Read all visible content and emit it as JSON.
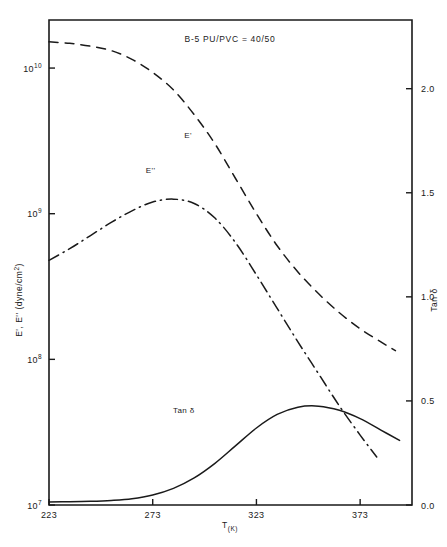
{
  "chart_data": {
    "type": "line",
    "title": "B-5  PU/PVC = 40/50",
    "xlabel": "T",
    "xlabel_sub": "(K)",
    "ylabel_left": "E', E'' (dyne/cm",
    "ylabel_left_exp": "2",
    "ylabel_left_close": ")",
    "ylabel_right": "Tan δ",
    "xlim": [
      223,
      398
    ],
    "x_ticks": [
      223,
      273,
      323,
      373
    ],
    "x_tick_labels": [
      "223",
      "273",
      "323",
      "373"
    ],
    "ylim_left_log": [
      7,
      10.33
    ],
    "y_ticks_left": [
      7,
      8,
      9,
      10
    ],
    "y_tick_labels_left": [
      "10",
      "10",
      "10",
      "10"
    ],
    "y_tick_exponents_left": [
      "7",
      "8",
      "9",
      "10"
    ],
    "ylim_right": [
      0.0,
      2.33
    ],
    "y_ticks_right": [
      0.0,
      0.5,
      1.0,
      1.5,
      2.0
    ],
    "y_tick_labels_right": [
      "0.0",
      "0.5",
      "1.0",
      "1.5",
      "2.0"
    ],
    "grid": false,
    "legend_position": "inline-annotations",
    "series": [
      {
        "name": "E'",
        "axis": "left",
        "style": "dashed",
        "label_x": 290,
        "label_y_log": 9.52,
        "x": [
          223,
          233,
          243,
          253,
          263,
          273,
          283,
          293,
          303,
          313,
          323,
          333,
          343,
          353,
          363,
          373,
          383,
          390
        ],
        "y_log": [
          10.18,
          10.17,
          10.15,
          10.12,
          10.06,
          9.97,
          9.85,
          9.68,
          9.48,
          9.24,
          9.0,
          8.78,
          8.6,
          8.45,
          8.32,
          8.21,
          8.12,
          8.06
        ]
      },
      {
        "name": "E''",
        "axis": "left",
        "style": "dash-dot",
        "label_x": 272,
        "label_y_log": 9.28,
        "x": [
          223,
          233,
          243,
          253,
          263,
          273,
          283,
          293,
          303,
          313,
          323,
          333,
          343,
          353,
          363,
          373,
          381
        ],
        "y_log": [
          8.68,
          8.76,
          8.85,
          8.94,
          9.02,
          9.08,
          9.1,
          9.07,
          8.97,
          8.8,
          8.58,
          8.35,
          8.12,
          7.9,
          7.68,
          7.48,
          7.33
        ]
      },
      {
        "name": "Tan δ",
        "axis": "right",
        "style": "solid",
        "label_x": 288,
        "label_y": 0.44,
        "x": [
          223,
          233,
          243,
          253,
          263,
          273,
          283,
          293,
          303,
          313,
          323,
          333,
          343,
          353,
          363,
          373,
          383,
          392
        ],
        "y": [
          0.015,
          0.016,
          0.018,
          0.022,
          0.03,
          0.048,
          0.08,
          0.13,
          0.2,
          0.285,
          0.37,
          0.435,
          0.47,
          0.475,
          0.455,
          0.415,
          0.36,
          0.31
        ]
      }
    ]
  },
  "figure": {
    "background_color": "#ffffff",
    "ink_color": "#1a1a1a"
  }
}
